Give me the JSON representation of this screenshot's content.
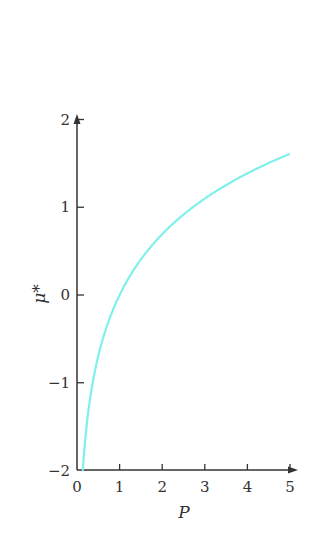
{
  "chart_data": {
    "type": "line",
    "title": "",
    "xlabel": "P",
    "ylabel": "μ*",
    "xlim": [
      0,
      5
    ],
    "ylim": [
      -2,
      2
    ],
    "xticks": [
      0,
      1,
      2,
      3,
      4,
      5
    ],
    "yticks": [
      -2,
      -1,
      0,
      1,
      2
    ],
    "xtick_labels": [
      "0",
      "1",
      "2",
      "3",
      "4",
      "5"
    ],
    "ytick_labels": [
      "−2",
      "−1",
      "0",
      "1",
      "2"
    ],
    "grid": false,
    "legend": null,
    "series": [
      {
        "name": "μ* vs P",
        "color": "#7ff0ec",
        "x": [
          0.135,
          0.2,
          0.3,
          0.5,
          0.75,
          1,
          1.5,
          2,
          2.5,
          3,
          3.5,
          4,
          4.5,
          5
        ],
        "y": [
          -2.0,
          -1.61,
          -1.2,
          -0.69,
          -0.29,
          0.0,
          0.41,
          0.69,
          0.92,
          1.1,
          1.25,
          1.39,
          1.5,
          1.57
        ]
      }
    ]
  },
  "colors": {
    "axis": "#333333",
    "curve": "#7ff0ec"
  }
}
